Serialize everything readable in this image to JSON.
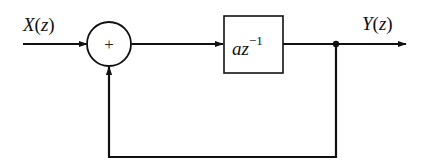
{
  "diagram": {
    "type": "block-diagram",
    "input_label": {
      "var": "X",
      "arg": "z"
    },
    "output_label": {
      "var": "Y",
      "arg": "z"
    },
    "summer": {
      "sign": "+"
    },
    "block": {
      "base": "az",
      "exponent": "−1"
    },
    "feedback": "unity feedback from output node to summing junction",
    "colors": {
      "stroke": "#111111",
      "background": "#ffffff"
    }
  }
}
